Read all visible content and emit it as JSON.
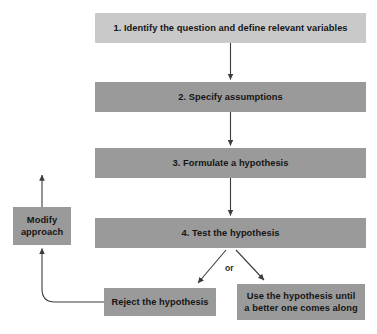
{
  "diagram": {
    "colors": {
      "step1_fill": "#c9c9c9",
      "step_fill": "#9a9a9a",
      "connector": "#3b3b3b",
      "text": "#151515"
    },
    "nodes": [
      {
        "id": "step1",
        "name": "identify-question-box",
        "label": "1. Identify the question and define relevant variables",
        "fill": "#c9c9c9",
        "x": 95,
        "y": 13,
        "width": 271,
        "height": 30
      },
      {
        "id": "step2",
        "name": "specify-assumptions-box",
        "label": "2. Specify assumptions",
        "fill": "#9a9a9a",
        "x": 95,
        "y": 82,
        "width": 271,
        "height": 30
      },
      {
        "id": "step3",
        "name": "formulate-hypothesis-box",
        "label": "3. Formulate a hypothesis",
        "fill": "#9a9a9a",
        "x": 95,
        "y": 148,
        "width": 271,
        "height": 30
      },
      {
        "id": "step4",
        "name": "test-hypothesis-box",
        "label": "4. Test the hypothesis",
        "fill": "#9a9a9a",
        "x": 95,
        "y": 218,
        "width": 271,
        "height": 30
      },
      {
        "id": "modify",
        "name": "modify-approach-box",
        "label": "Modify approach",
        "line1": "Modify",
        "line2": "approach",
        "fill": "#9a9a9a",
        "x": 13,
        "y": 207,
        "width": 58,
        "height": 38
      },
      {
        "id": "reject",
        "name": "reject-hypothesis-box",
        "label": "Reject the hypothesis",
        "fill": "#9a9a9a",
        "x": 104,
        "y": 288,
        "width": 112,
        "height": 28
      },
      {
        "id": "use",
        "name": "use-hypothesis-box",
        "label": "Use the hypothesis until a better one comes along",
        "line1": "Use the hypothesis until",
        "line2": "a better one comes along",
        "fill": "#9a9a9a",
        "x": 237,
        "y": 284,
        "width": 128,
        "height": 36
      }
    ],
    "branch_label": "or",
    "connectors": [
      {
        "name": "connector-step1-to-step2",
        "from": "step1",
        "to": "step2"
      },
      {
        "name": "connector-step2-to-step3",
        "from": "step2",
        "to": "step3"
      },
      {
        "name": "connector-step3-to-step4",
        "from": "step3",
        "to": "step4"
      },
      {
        "name": "connector-step4-to-reject",
        "from": "step4",
        "to": "reject"
      },
      {
        "name": "connector-step4-to-use",
        "from": "step4",
        "to": "use"
      },
      {
        "name": "connector-reject-to-modify",
        "from": "reject",
        "to": "modify"
      },
      {
        "name": "connector-modify-upward",
        "from": "modify",
        "to": "step3"
      }
    ]
  }
}
